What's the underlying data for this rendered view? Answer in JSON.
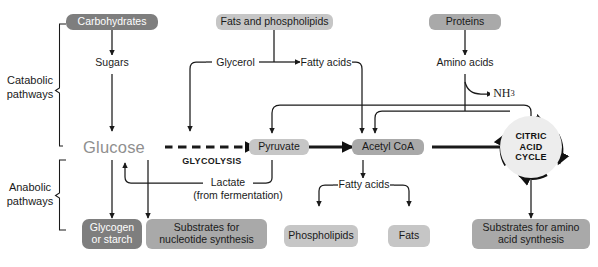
{
  "figure": {
    "colors": {
      "box_dark": "#7e7e7e",
      "box_medium": "#a9a9a9",
      "box_light": "#c6c6c6",
      "glucose_text": "#8f8f8f",
      "line": "#1a1a1a",
      "circle_fill": "#ededed",
      "background": "#ffffff"
    }
  },
  "brackets": {
    "catabolic": {
      "line1": "Catabolic",
      "line2": "pathways"
    },
    "anabolic": {
      "line1": "Anabolic",
      "line2": "pathways"
    }
  },
  "inputs": {
    "carbohydrates": "Carbohydrates",
    "fats_phospholipids": "Fats and phospholipids",
    "proteins": "Proteins"
  },
  "intermediates": {
    "sugars": "Sugars",
    "glycerol": "Glycerol",
    "fatty_acids_top": "Fatty acids",
    "amino_acids": "Amino acids",
    "ammonia": "NH",
    "ammonia_sub": "3",
    "glucose": "Glucose",
    "glycolysis": "GLYCOLYSIS",
    "pyruvate": "Pyruvate",
    "acetyl_coa": "Acetyl CoA",
    "lactate": "Lactate",
    "lactate_note": "(from fermentation)",
    "fatty_acids_bottom": "Fatty acids"
  },
  "cycle": {
    "line1": "CITRIC",
    "line2": "ACID",
    "line3": "CYCLE"
  },
  "outputs": {
    "glycogen_or_starch": "Glycogen or starch",
    "glycogen_line1": "Glycogen",
    "glycogen_line2": "or starch",
    "nucleotide_substrates": "Substrates for nucleotide synthesis",
    "nucleotide_line1": "Substrates for",
    "nucleotide_line2": "nucleotide synthesis",
    "phospholipids": "Phospholipids",
    "fats": "Fats",
    "amino_substrates": "Substrates for amino acid synthesis",
    "amino_line1": "Substrates for amino",
    "amino_line2": "acid synthesis"
  }
}
